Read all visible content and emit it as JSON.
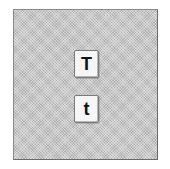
{
  "panel": {
    "buttons": [
      {
        "label": "T",
        "role": "uppercase"
      },
      {
        "label": "t",
        "role": "lowercase"
      }
    ]
  }
}
